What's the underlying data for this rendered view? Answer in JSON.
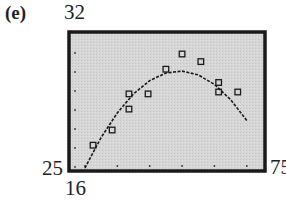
{
  "panel": {
    "label": "(e)"
  },
  "axes": {
    "ymax_label": "32",
    "ymin_label": "25",
    "xmin_label": "16",
    "xmax_label": "75"
  },
  "colors": {
    "frame": "#1a1a1a",
    "background": "#d4d4d4",
    "points": "#1a1a1a",
    "curve": "#1a1a1a"
  },
  "chart_data": {
    "type": "scatter",
    "title": "",
    "panel_label": "(e)",
    "xlabel": "",
    "ylabel": "",
    "xlim": [
      16,
      75
    ],
    "ylim": [
      25,
      32
    ],
    "grid": false,
    "tick_dots": true,
    "legend": null,
    "series": [
      {
        "name": "data",
        "kind": "scatter",
        "marker": "square",
        "x": [
          22.5,
          28.4,
          33.6,
          33.6,
          39.5,
          45.0,
          50.0,
          55.8,
          61.3,
          61.3,
          67.2
        ],
        "y": [
          26.2,
          27.0,
          28.1,
          28.9,
          28.9,
          30.2,
          31.0,
          30.6,
          29.5,
          29.0,
          29.0
        ]
      },
      {
        "name": "quadratic fit",
        "kind": "line",
        "x": [
          20,
          25,
          30,
          35,
          40,
          45,
          50,
          55,
          60,
          65,
          70
        ],
        "y": [
          25.0,
          26.6,
          27.9,
          28.9,
          29.6,
          30.0,
          30.1,
          29.9,
          29.4,
          28.6,
          27.5
        ]
      }
    ]
  }
}
